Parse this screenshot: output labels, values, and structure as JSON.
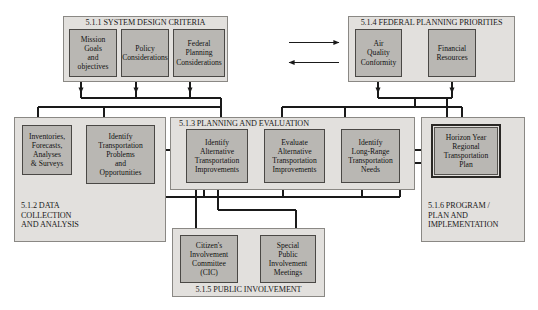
{
  "diagram": {
    "colors": {
      "panel_fill": "#e2e0dd",
      "panel_border": "#8a8884",
      "node_fill": "#b9b7b3",
      "node_border": "#4a4845",
      "emphasis_border": "#2a2825",
      "connector": "#1a1a1a",
      "background": "#ffffff"
    },
    "panels": [
      {
        "id": "p511",
        "label": "5.1.1 SYSTEM DESIGN CRITERIA",
        "title_position": "top-center",
        "nodes": [
          {
            "id": "n-mission",
            "label": "Mission\nGoals\nand\nobjectives"
          },
          {
            "id": "n-policy",
            "label": "Policy\nConsiderations"
          },
          {
            "id": "n-fedplan",
            "label": "Federal\nPlanning\nConsiderations"
          }
        ]
      },
      {
        "id": "p514",
        "label": "5.1.4 FEDERAL PLANNING PRIORITIES",
        "title_position": "top-center",
        "nodes": [
          {
            "id": "n-air",
            "label": "Air\nQuality\nConformity"
          },
          {
            "id": "n-finance",
            "label": "Financial\nResources"
          }
        ]
      },
      {
        "id": "p512",
        "label": "5.1.2 DATA\nCOLLECTION\nAND ANALYSIS",
        "title_position": "bottom-left",
        "nodes": [
          {
            "id": "n-inventories",
            "label": "Inventories,\nForecasts,\nAnalyses\n& Surveys"
          },
          {
            "id": "n-identprob",
            "label": "Identify\nTransportation\nProblems\nand\nOpportunities"
          }
        ]
      },
      {
        "id": "p513",
        "label": "5.1.3 PLANNING AND EVALUATION",
        "title_position": "top-left",
        "nodes": [
          {
            "id": "n-identalt",
            "label": "Identify\nAlternative\nTransportation\nImprovements"
          },
          {
            "id": "n-evalalt",
            "label": "Evaluate\nAlternative\nTransportation\nImprovements"
          },
          {
            "id": "n-longrange",
            "label": "Identify\nLong-Range\nTransportation\nNeeds"
          }
        ]
      },
      {
        "id": "p516",
        "label": "5.1.6 PROGRAM /\nPLAN AND\nIMPLEMENTATION",
        "title_position": "bottom-left",
        "nodes": [
          {
            "id": "n-horizon",
            "label": "Horizon Year\nRegional\nTransportation\nPlan"
          }
        ]
      },
      {
        "id": "p515",
        "label": "5.1.5 PUBLIC INVOLVEMENT",
        "title_position": "bottom-center",
        "nodes": [
          {
            "id": "n-cic",
            "label": "Citizen's\nInvolvement\nCommittee\n(CIC)"
          },
          {
            "id": "n-special",
            "label": "Special\nPublic\nInvolvement\nMeetings"
          }
        ]
      }
    ],
    "connectors": [
      {
        "id": "c-511-to-514",
        "kind": "arrow-right",
        "from": "p511",
        "to": "p514"
      },
      {
        "id": "c-514-to-511",
        "kind": "arrow-left",
        "from": "p514",
        "to": "p511"
      },
      {
        "id": "c-criteria-bus",
        "kind": "bus-down",
        "from": "p511",
        "to": "p512,p513"
      },
      {
        "id": "c-priorities-bus",
        "kind": "bus-down",
        "from": "p514",
        "to": "p513,p516"
      },
      {
        "id": "c-inv-to-prob",
        "kind": "arrow-right",
        "from": "n-inventories",
        "to": "n-identprob"
      },
      {
        "id": "c-prob-to-alt",
        "kind": "arrow-right",
        "from": "n-identprob",
        "to": "n-identalt"
      },
      {
        "id": "c-alt-to-eval",
        "kind": "arrow-right",
        "from": "n-identalt",
        "to": "n-evalalt"
      },
      {
        "id": "c-eval-to-long",
        "kind": "arrow-right",
        "from": "n-evalalt",
        "to": "n-longrange"
      },
      {
        "id": "c-long-to-horizon",
        "kind": "arrow-right",
        "from": "n-longrange",
        "to": "n-horizon"
      },
      {
        "id": "c-feedback-bus",
        "kind": "feedback-bus",
        "from": "n-horizon",
        "to": "n-inventories,n-identprob,n-identalt,n-evalalt,n-longrange"
      },
      {
        "id": "c-cic-up",
        "kind": "arrow-up",
        "from": "n-cic",
        "to": "n-identalt"
      },
      {
        "id": "c-special-up",
        "kind": "arrow-up",
        "from": "n-special",
        "to": "n-identalt"
      }
    ]
  }
}
